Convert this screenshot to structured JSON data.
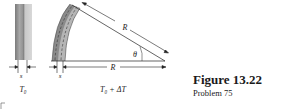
{
  "figure": {
    "title": "Figure 13.22",
    "subtitle": "Problem 75"
  },
  "left_strip": {
    "thickness_label": "s",
    "temperature_label": "T₀"
  },
  "bent_strip": {
    "thickness_label": "s",
    "temperature_label": "T₀ + ΔT",
    "radius_label_upper": "R",
    "radius_label_lower": "R",
    "angle_label": "θ"
  }
}
